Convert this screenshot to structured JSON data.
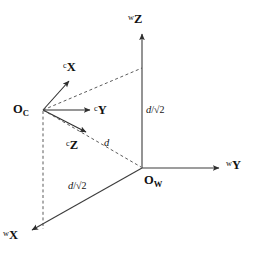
{
  "diagram": {
    "colors": {
      "stroke": "#3c3c3c",
      "dashed": "#4a4a4a",
      "text": "#111111",
      "background": "#ffffff"
    },
    "world_frame": {
      "origin_label": {
        "symbol": "O",
        "subscript": "W"
      },
      "axes": [
        {
          "name": "world-x-axis",
          "prefix": "w",
          "letter": "X"
        },
        {
          "name": "world-y-axis",
          "prefix": "w",
          "letter": "Y"
        },
        {
          "name": "world-z-axis",
          "prefix": "w",
          "letter": "Z"
        }
      ]
    },
    "camera_frame": {
      "origin_label": {
        "symbol": "O",
        "subscript": "C"
      },
      "axes": [
        {
          "name": "camera-x-axis",
          "prefix": "c",
          "letter": "X"
        },
        {
          "name": "camera-y-axis",
          "prefix": "c",
          "letter": "Y"
        },
        {
          "name": "camera-z-axis",
          "prefix": "c",
          "letter": "Z"
        }
      ]
    },
    "measurements": [
      {
        "name": "height-measure",
        "numerator": "d",
        "separator": "/",
        "radical": "√2",
        "full": "d/√2"
      },
      {
        "name": "baseline-measure",
        "numerator": "d",
        "separator": "/",
        "radical": "√2",
        "full": "d/√2"
      },
      {
        "name": "distance-measure",
        "numerator": "d",
        "separator": "",
        "radical": "",
        "full": "d"
      }
    ]
  }
}
